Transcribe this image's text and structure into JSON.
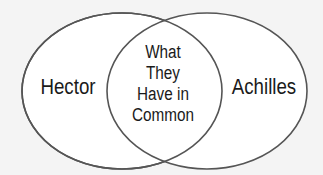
{
  "diagram": {
    "type": "venn",
    "left_circle": {
      "label": "Hector"
    },
    "right_circle": {
      "label": "Achilles"
    },
    "intersection": {
      "lines": [
        "What",
        "They",
        "Have in",
        "Common"
      ]
    },
    "colors": {
      "background": "#f4f4f4",
      "fill": "#ffffff",
      "stroke": "#555555",
      "text": "#1a1a1a"
    }
  }
}
